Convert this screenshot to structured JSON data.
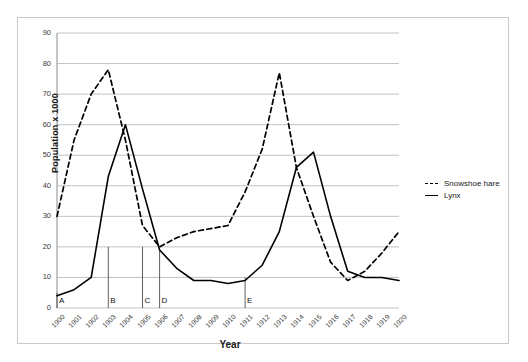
{
  "chart_data": {
    "type": "line",
    "title": "",
    "xlabel": "Year",
    "ylabel": "Population x 1000",
    "xlim": [
      1900,
      1920
    ],
    "ylim": [
      0,
      90
    ],
    "ytick_values": [
      0,
      10,
      20,
      30,
      40,
      50,
      60,
      70,
      80,
      90
    ],
    "ytick_labels": [
      "0",
      "10",
      "20",
      "30",
      "40",
      "50",
      "60",
      "70",
      "80",
      "90"
    ],
    "grid": "horizontal",
    "legend_position": "right",
    "x": [
      1900,
      1901,
      1902,
      1903,
      1904,
      1905,
      1906,
      1907,
      1908,
      1909,
      1910,
      1911,
      1912,
      1913,
      1914,
      1915,
      1916,
      1917,
      1918,
      1919,
      1920
    ],
    "categories": [
      "1900",
      "1901",
      "1902",
      "1903",
      "1904",
      "1905",
      "1906",
      "1907",
      "1908",
      "1909",
      "1910",
      "1911",
      "1912",
      "1913",
      "1914",
      "1915",
      "1916",
      "1917",
      "1918",
      "1919",
      "1920"
    ],
    "series": [
      {
        "name": "Snowshoe hare",
        "style": "dashed",
        "color": "#000000",
        "values": [
          30,
          55,
          70,
          78,
          55,
          27,
          20,
          23,
          25,
          26,
          27,
          38,
          52,
          77,
          46,
          30,
          15,
          9,
          12,
          18,
          25
        ]
      },
      {
        "name": "Lynx",
        "style": "solid",
        "color": "#000000",
        "values": [
          4,
          6,
          10,
          43,
          60,
          39,
          19,
          13,
          9,
          9,
          8,
          9,
          14,
          25,
          46,
          51,
          30,
          12,
          10,
          10,
          9
        ]
      }
    ],
    "annotations": [
      {
        "label": "A",
        "year": 1900,
        "top_value": 5
      },
      {
        "label": "B",
        "year": 1903,
        "top_value": 20
      },
      {
        "label": "C",
        "year": 1905,
        "top_value": 20
      },
      {
        "label": "D",
        "year": 1906,
        "top_value": 19
      },
      {
        "label": "E",
        "year": 1911,
        "top_value": 10
      }
    ]
  },
  "legend": {
    "items": [
      {
        "label": "Snowshoe hare",
        "style": "dashed"
      },
      {
        "label": "Lynx",
        "style": "solid"
      }
    ]
  }
}
